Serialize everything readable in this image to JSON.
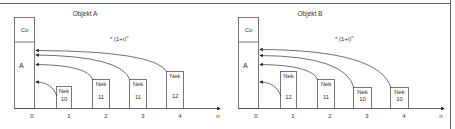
{
  "frame": {
    "line_color": "#555555"
  },
  "panels": [
    {
      "title": "Objekt A",
      "formula": "* (1+i)",
      "formula_exp": "n",
      "present_value_box": {
        "top_label": "Co",
        "bottom_label": "A"
      },
      "axis": {
        "ticks": [
          "0",
          "1",
          "2",
          "3",
          "4"
        ],
        "end_label": "n"
      },
      "payments": [
        {
          "label": "Nek",
          "value": "10"
        },
        {
          "label": "Nek",
          "value": "11"
        },
        {
          "label": "Nek",
          "value": "11"
        },
        {
          "label": "Nek",
          "value": "12"
        }
      ]
    },
    {
      "title": "Objekt B",
      "formula": "* (1+i)",
      "formula_exp": "n",
      "present_value_box": {
        "top_label": "Co",
        "bottom_label": "A"
      },
      "axis": {
        "ticks": [
          "0",
          "1",
          "2",
          "3",
          "4"
        ],
        "end_label": "n"
      },
      "payments": [
        {
          "label": "Nek",
          "value": "12"
        },
        {
          "label": "Nek",
          "value": "11"
        },
        {
          "label": "Nek",
          "value": "10"
        },
        {
          "label": "Nek",
          "value": "10"
        }
      ]
    }
  ]
}
